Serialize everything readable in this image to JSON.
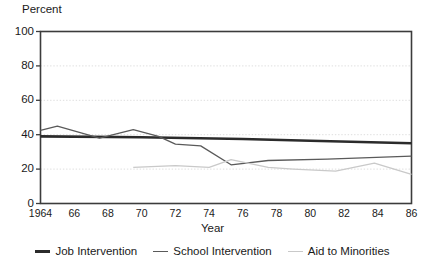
{
  "chart_data": {
    "type": "line",
    "title": "",
    "xlabel": "Year",
    "ylabel": "Percent",
    "ylim": [
      0,
      100
    ],
    "xlim": [
      1964,
      1986
    ],
    "yticks": [
      0,
      20,
      40,
      60,
      80,
      100
    ],
    "ytick_labels": [
      "0",
      "20",
      "40",
      "60",
      "80",
      "100"
    ],
    "xticks": [
      1964,
      1966,
      1968,
      1970,
      1972,
      1974,
      1976,
      1978,
      1980,
      1982,
      1984,
      1986
    ],
    "xtick_labels": [
      "1964",
      "66",
      "68",
      "70",
      "72",
      "74",
      "76",
      "78",
      "80",
      "82",
      "84",
      "86"
    ],
    "grid": "horizontal-dotted-light",
    "legend_position": "bottom-center",
    "series": [
      {
        "name": "Job Intervention",
        "color": "#2b2b2b",
        "width": 2.6,
        "x": [
          1964,
          1970,
          1976,
          1980,
          1986
        ],
        "values": [
          39,
          38.5,
          37.5,
          36.5,
          35
        ]
      },
      {
        "name": "School Intervention",
        "color": "#5a5a5a",
        "width": 1.3,
        "x": [
          1964,
          1965,
          1967.5,
          1969.5,
          1971,
          1972,
          1973.5,
          1975.3,
          1977.5,
          1981,
          1986
        ],
        "values": [
          42.5,
          45,
          38,
          43,
          39,
          34.5,
          33.5,
          22.5,
          25,
          25.8,
          27.5
        ]
      },
      {
        "name": "Aid to Minorities",
        "color": "#c9c9c9",
        "width": 1.3,
        "x": [
          1969.5,
          1972,
          1974,
          1975.3,
          1977.5,
          1979,
          1981.5,
          1983.8,
          1986
        ],
        "values": [
          21,
          22,
          21,
          25.5,
          21,
          20,
          18.8,
          23.5,
          17
        ]
      }
    ]
  },
  "legend": {
    "items": [
      {
        "label": "Job Intervention",
        "color": "#2b2b2b",
        "width": 3
      },
      {
        "label": "School Intervention",
        "color": "#5a5a5a",
        "width": 1.6
      },
      {
        "label": "Aid to Minorities",
        "color": "#c9c9c9",
        "width": 1.6
      }
    ]
  },
  "axes": {
    "frame_color": "#3c3c3c",
    "grid_color": "#dedede"
  }
}
